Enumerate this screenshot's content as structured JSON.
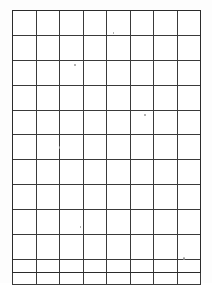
{
  "document": {
    "type": "blank-grid-worksheet",
    "title": "",
    "background_color": "#ffffff",
    "page_width": 212,
    "page_height": 283
  },
  "grid": {
    "columns": 8,
    "rows": 11,
    "left": 12,
    "top": 10,
    "width": 189,
    "height": 263,
    "cell_width": 23.6,
    "cell_height": 23.9,
    "line_color": "#3a3a3a",
    "faint_line_color": "#8a8a8a",
    "frame_color": "#2b2b2b",
    "cell_background": "#ffffff",
    "column_headers": [
      "",
      "",
      "",
      "",
      "",
      "",
      "",
      ""
    ],
    "cells": [
      [
        "",
        "",
        "",
        "",
        "",
        "",
        "",
        ""
      ],
      [
        "",
        "",
        "",
        "",
        "",
        "",
        "",
        ""
      ],
      [
        "",
        "",
        "",
        "",
        "",
        "",
        "",
        ""
      ],
      [
        "",
        "",
        "",
        "",
        "",
        "",
        "",
        ""
      ],
      [
        "",
        "",
        "",
        "",
        "",
        "",
        "",
        ""
      ],
      [
        "",
        "",
        "",
        "",
        "",
        "",
        "",
        ""
      ],
      [
        "",
        "",
        "",
        "",
        "",
        "",
        "",
        ""
      ],
      [
        "",
        "",
        "",
        "",
        "",
        "",
        "",
        ""
      ],
      [
        "",
        "",
        "",
        "",
        "",
        "",
        "",
        ""
      ],
      [
        "",
        "",
        "",
        "",
        "",
        "",
        "",
        ""
      ],
      [
        "",
        "",
        "",
        "",
        "",
        "",
        "",
        ""
      ]
    ]
  },
  "artifacts": {
    "specks": [
      {
        "name": "speck-1",
        "x": 74,
        "y": 64
      },
      {
        "name": "speck-2",
        "x": 144,
        "y": 114
      },
      {
        "name": "speck-3",
        "x": 59,
        "y": 146
      },
      {
        "name": "speck-4",
        "x": 183,
        "y": 257
      },
      {
        "name": "speck-5",
        "x": 113,
        "y": 32
      },
      {
        "name": "speck-6",
        "x": 80,
        "y": 226
      }
    ]
  }
}
